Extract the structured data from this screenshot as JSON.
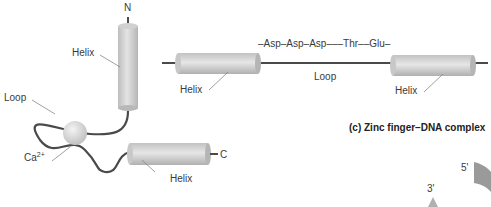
{
  "ef_hand": {
    "n_terminus": "N",
    "c_terminus": "C",
    "helix_top_label": "Helix",
    "helix_bottom_label": "Helix",
    "loop_label": "Loop",
    "ion_label": "Ca",
    "ion_charge": "2+"
  },
  "sequence_diagram": {
    "sequence": "–Asp–Asp–Asp–––Thr––Glu–",
    "loop_label": "Loop",
    "helix_left_label": "Helix",
    "helix_right_label": "Helix"
  },
  "zinc_finger": {
    "title": "(c) Zinc finger–DNA complex",
    "five_prime": "5'",
    "three_prime": "3'"
  },
  "colors": {
    "helix_fill": "#d4d4d4",
    "strand": "#4a4a4a",
    "dna": "#9a9a9a"
  }
}
